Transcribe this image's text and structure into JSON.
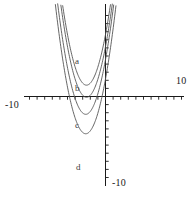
{
  "chart_data": {
    "type": "line",
    "title": "",
    "xlabel": "",
    "ylabel": "",
    "xlim": [
      -10,
      10
    ],
    "ylim": [
      -10,
      10
    ],
    "grid": false,
    "legend": "inline-curve-labels",
    "axis_tick_step": 1,
    "tick_labels": {
      "x_min": "-10",
      "x_max": "10",
      "y_min": "-10"
    },
    "series": [
      {
        "name": "a",
        "label": "a",
        "vertex": [
          -2.5,
          1.4
        ],
        "leading_coefficient": 1,
        "color": "#555555"
      },
      {
        "name": "b",
        "label": "b",
        "vertex": [
          -2.5,
          -0.1
        ],
        "leading_coefficient": 1,
        "color": "#555555"
      },
      {
        "name": "c",
        "label": "c",
        "vertex": [
          -2.6,
          -2.2
        ],
        "leading_coefficient": 1,
        "color": "#555555"
      },
      {
        "name": "d",
        "label": "d",
        "vertex": [
          -2.6,
          -4.6
        ],
        "leading_coefficient": 1,
        "color": "#555555"
      }
    ]
  },
  "figure": {
    "background": "#ffffff",
    "axis_color": "#1a1a1a",
    "curve_color": "#555555"
  }
}
